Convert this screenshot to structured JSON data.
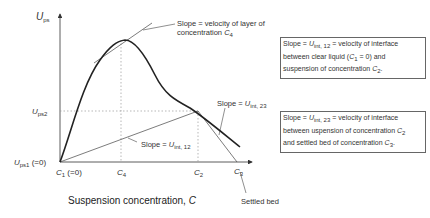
{
  "diagram": {
    "y_axis": {
      "symbol": "U",
      "subscript": "ps"
    },
    "x_axis": {
      "title_prefix": "Suspension concentration, ",
      "title_var": "C"
    },
    "y_ticks": [
      {
        "symbol": "U",
        "subscript": "ps2",
        "suffix": ""
      },
      {
        "symbol": "U",
        "subscript": "ps1",
        "suffix": " (=0)"
      }
    ],
    "x_ticks": [
      {
        "symbol": "C",
        "subscript": "1",
        "suffix": " (=0)"
      },
      {
        "symbol": "C",
        "subscript": "4",
        "suffix": ""
      },
      {
        "symbol": "C",
        "subscript": "2",
        "suffix": ""
      },
      {
        "symbol": "C",
        "subscript": "3",
        "suffix": ""
      }
    ],
    "annotations": {
      "tangent_slope": {
        "line1": "Slope = velocity of layer of",
        "line2_prefix": "concentration ",
        "line2_var": "C",
        "line2_sub": "4"
      },
      "slope_12": {
        "prefix": "Slope = ",
        "var": "U",
        "sub": "int, 12"
      },
      "slope_23": {
        "prefix": "Slope = ",
        "var": "U",
        "sub": "int, 23"
      },
      "settled_bed": "Settled bed"
    },
    "boxes": {
      "box1": {
        "l1_prefix": "Slope = ",
        "l1_var": "U",
        "l1_sub": "int, 12",
        "l1_suffix": " = velocity of interface",
        "l2_prefix": "between clear liquid (",
        "l2_var": "C",
        "l2_sub": "1",
        "l2_suffix": " = 0) and",
        "l3_prefix": "suspension of concentration ",
        "l3_var": "C",
        "l3_sub": "2",
        "l3_suffix": "."
      },
      "box2": {
        "l1_prefix": "Slope = ",
        "l1_var": "U",
        "l1_sub": "int, 23",
        "l1_suffix": " = velocity of interface",
        "l2_prefix": "between  uspension of concentration ",
        "l2_var": "C",
        "l2_sub": "2",
        "l3_prefix": "and settled bed of concentration ",
        "l3_var": "C",
        "l3_sub": "3",
        "l3_suffix": "."
      }
    },
    "colors": {
      "curve": "#222222",
      "lines": "#444444",
      "dotted": "#999999"
    }
  }
}
